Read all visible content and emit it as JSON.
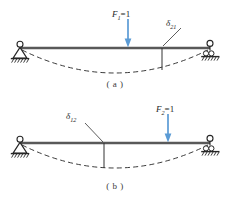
{
  "figure": {
    "diagram_a": {
      "caption": "( a )",
      "load_label": {
        "symbol": "F",
        "sub": "1",
        "eq": "=1"
      },
      "displacement_label": {
        "symbol": "δ",
        "sub": "21"
      },
      "load_x": 128,
      "beam_y": 48,
      "span_left": 20,
      "span_right": 210,
      "probe_x": 162,
      "max_deflection": 22,
      "arrow_color": "#5b9bd5",
      "beam_color": "#595959",
      "curve_color": "#262626",
      "support_left_type": "pin",
      "support_right_type": "roller"
    },
    "diagram_b": {
      "caption": "( b )",
      "load_label": {
        "symbol": "F",
        "sub": "2",
        "eq": "=1"
      },
      "displacement_label": {
        "symbol": "δ",
        "sub": "12"
      },
      "load_x": 168,
      "beam_y": 143,
      "span_left": 20,
      "span_right": 210,
      "probe_x": 104,
      "max_deflection": 22,
      "arrow_color": "#5b9bd5",
      "beam_color": "#595959",
      "curve_color": "#262626",
      "support_left_type": "pin",
      "support_right_type": "roller"
    }
  }
}
